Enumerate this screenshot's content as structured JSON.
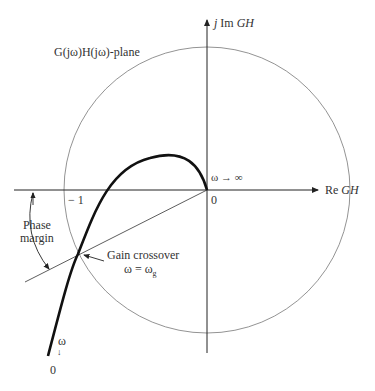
{
  "diagram": {
    "type": "nyquist-plot",
    "plane_label": "G(jω)H(jω)-plane",
    "imag_axis_label": {
      "prefix": "j",
      "text": " Im ",
      "var": "GH"
    },
    "real_axis_label": {
      "text": "Re ",
      "var": "GH"
    },
    "minus_one_label": "− 1",
    "origin_label": "0",
    "omega_inf_label": "ω → ∞",
    "phase_margin_label": [
      "Phase",
      "margin"
    ],
    "gain_crossover_label": "Gain crossover",
    "gain_crossover_eq": "ω = ω",
    "gain_crossover_sub": "g",
    "omega_start_label": "ω",
    "omega_arrow": "↓",
    "omega_zero_label": "0",
    "colors": {
      "curve": "#111111",
      "axis": "#222222",
      "circle": "#666666"
    }
  }
}
